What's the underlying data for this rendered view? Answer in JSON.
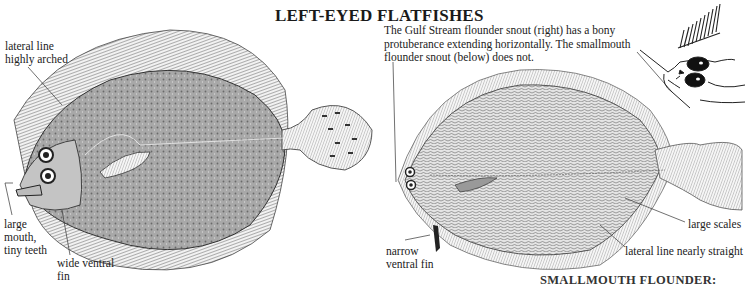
{
  "page": {
    "title": "LEFT-EYED FLATFISHES",
    "bottom_caption_partial": "SMALLMOUTH FLOUNDER:"
  },
  "left_fish": {
    "species_illustration": "left-eyed flatfish (highly arched lateral line)",
    "labels": {
      "lateral_line": "lateral line highly arched",
      "mouth": "large mouth, tiny teeth",
      "ventral_fin": "wide ventral fin"
    }
  },
  "right_fish": {
    "species_illustration": "smallmouth flounder",
    "note": "The Gulf Stream flounder snout (right) has a bony protuberance extending horizontally. The smallmouth flounder snout (below) does not.",
    "labels": {
      "ventral_fin": "narrow ventral fin",
      "scales": "large scales",
      "lateral_line": "lateral line nearly straight"
    }
  },
  "inset": {
    "illustration": "Gulf Stream flounder snout detail"
  },
  "colors": {
    "background": "#ffffff",
    "ink": "#1a1a1a",
    "fish_body": "#9a9a9a"
  }
}
